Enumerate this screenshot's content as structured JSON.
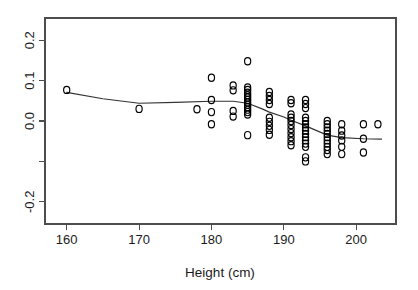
{
  "chart_data": {
    "type": "scatter",
    "title": "",
    "subtitle": "",
    "xlabel": "Height (cm)",
    "ylabel": "",
    "xlim": [
      157.0,
      205.5
    ],
    "ylim": [
      -0.255,
      0.255
    ],
    "xticks": [
      160,
      170,
      180,
      190,
      200
    ],
    "xtick_labels": [
      "160",
      "170",
      "180",
      "190",
      "200"
    ],
    "yticks": [
      0.2,
      0.1,
      0.0,
      -0.1,
      -0.2
    ],
    "ytick_labels": [
      "0.2",
      "0.1",
      "0.0",
      "",
      "-0.2"
    ],
    "grid": false,
    "legend": null,
    "legend_position": "none",
    "point_marker": "open-circle",
    "point_color": "#000000",
    "line_color": "#333333",
    "annotations": [],
    "series": [
      {
        "name": "residuals",
        "type": "scatter",
        "points": [
          [
            160.0,
            0.077
          ],
          [
            170.0,
            0.03
          ],
          [
            178.0,
            0.029
          ],
          [
            180.0,
            0.107
          ],
          [
            180.0,
            0.052
          ],
          [
            180.0,
            0.022
          ],
          [
            180.0,
            -0.008
          ],
          [
            183.0,
            0.088
          ],
          [
            183.0,
            0.076
          ],
          [
            183.0,
            0.025
          ],
          [
            183.0,
            0.011
          ],
          [
            185.0,
            0.148
          ],
          [
            185.0,
            0.083
          ],
          [
            185.0,
            0.077
          ],
          [
            185.0,
            0.07
          ],
          [
            185.0,
            0.064
          ],
          [
            185.0,
            0.058
          ],
          [
            185.0,
            0.052
          ],
          [
            185.0,
            0.046
          ],
          [
            185.0,
            0.04
          ],
          [
            185.0,
            0.034
          ],
          [
            185.0,
            0.028
          ],
          [
            185.0,
            0.022
          ],
          [
            185.0,
            0.016
          ],
          [
            185.0,
            -0.035
          ],
          [
            188.0,
            0.072
          ],
          [
            188.0,
            0.062
          ],
          [
            188.0,
            0.052
          ],
          [
            188.0,
            0.042
          ],
          [
            188.0,
            0.008
          ],
          [
            188.0,
            -0.002
          ],
          [
            188.0,
            -0.012
          ],
          [
            188.0,
            -0.022
          ],
          [
            188.0,
            -0.034
          ],
          [
            191.0,
            0.052
          ],
          [
            191.0,
            0.044
          ],
          [
            191.0,
            0.016
          ],
          [
            191.0,
            0.008
          ],
          [
            191.0,
            0.0
          ],
          [
            191.0,
            -0.01
          ],
          [
            191.0,
            -0.02
          ],
          [
            191.0,
            -0.03
          ],
          [
            191.0,
            -0.04
          ],
          [
            191.0,
            -0.05
          ],
          [
            191.0,
            -0.06
          ],
          [
            193.0,
            0.052
          ],
          [
            193.0,
            0.042
          ],
          [
            193.0,
            0.032
          ],
          [
            193.0,
            0.008
          ],
          [
            193.0,
            0.0
          ],
          [
            193.0,
            -0.008
          ],
          [
            193.0,
            -0.016
          ],
          [
            193.0,
            -0.024
          ],
          [
            193.0,
            -0.032
          ],
          [
            193.0,
            -0.04
          ],
          [
            193.0,
            -0.048
          ],
          [
            193.0,
            -0.056
          ],
          [
            193.0,
            -0.064
          ],
          [
            193.0,
            -0.09
          ],
          [
            193.0,
            -0.1
          ],
          [
            196.0,
            0.0
          ],
          [
            196.0,
            -0.008
          ],
          [
            196.0,
            -0.016
          ],
          [
            196.0,
            -0.024
          ],
          [
            196.0,
            -0.032
          ],
          [
            196.0,
            -0.04
          ],
          [
            196.0,
            -0.048
          ],
          [
            196.0,
            -0.056
          ],
          [
            196.0,
            -0.064
          ],
          [
            196.0,
            -0.072
          ],
          [
            196.0,
            -0.082
          ],
          [
            198.0,
            -0.008
          ],
          [
            198.0,
            -0.024
          ],
          [
            198.0,
            -0.036
          ],
          [
            198.0,
            -0.048
          ],
          [
            198.0,
            -0.064
          ],
          [
            198.0,
            -0.082
          ],
          [
            201.0,
            -0.008
          ],
          [
            201.0,
            -0.044
          ],
          [
            201.0,
            -0.078
          ],
          [
            203.0,
            -0.008
          ]
        ]
      },
      {
        "name": "lowess-smoother",
        "type": "line",
        "points": [
          [
            160.0,
            0.071
          ],
          [
            165.0,
            0.055
          ],
          [
            170.0,
            0.044
          ],
          [
            175.0,
            0.046
          ],
          [
            180.0,
            0.049
          ],
          [
            183.0,
            0.049
          ],
          [
            185.0,
            0.044
          ],
          [
            187.0,
            0.03
          ],
          [
            188.0,
            0.022
          ],
          [
            190.0,
            0.01
          ],
          [
            191.0,
            0.002
          ],
          [
            193.0,
            -0.012
          ],
          [
            196.0,
            -0.035
          ],
          [
            198.0,
            -0.041
          ],
          [
            201.0,
            -0.044
          ],
          [
            203.5,
            -0.045
          ]
        ]
      }
    ]
  },
  "axes": {
    "x_title": "Height (cm)"
  }
}
